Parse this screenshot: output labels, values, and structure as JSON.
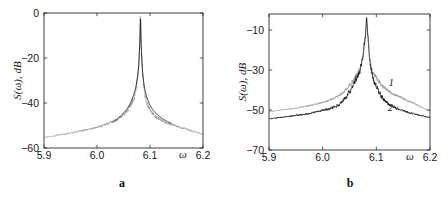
{
  "figure": {
    "background_color": "#ffffff",
    "panels": [
      {
        "caption": "a",
        "ylabel": "S(ω), dB",
        "xlabel": "ω"
      },
      {
        "caption": "b",
        "ylabel": "S(ω), dB",
        "xlabel": "ω"
      }
    ]
  },
  "chart_data": [
    {
      "type": "line",
      "panel": "a",
      "title": "",
      "xlabel": "ω",
      "ylabel": "S(ω), dB",
      "xlim": [
        5.9,
        6.2
      ],
      "ylim": [
        -60,
        0
      ],
      "xticks": [
        5.9,
        6.0,
        6.1,
        6.2
      ],
      "xticklabels": [
        "5.9",
        "6.0",
        "6.1",
        "6.2"
      ],
      "yticks": [
        -60,
        -40,
        -20,
        0
      ],
      "yticklabels": [
        "−60",
        "−40",
        "−20",
        "0"
      ],
      "grid": false,
      "legend": "none",
      "peak_omega": 6.082,
      "peak_value_db": 0,
      "series": [
        {
          "name": "experimental-noisy-spectrum",
          "color": "#9a9a9a",
          "linewidth": 0.6,
          "description": "Noisy measured spectrum, broad noise floor rising toward the resonance peak",
          "noise_amplitude_db": 2.2,
          "x": [
            5.9,
            5.91,
            5.92,
            5.93,
            5.94,
            5.95,
            5.96,
            5.97,
            5.98,
            5.99,
            6.0,
            6.01,
            6.02,
            6.03,
            6.04,
            6.05,
            6.055,
            6.06,
            6.065,
            6.07,
            6.074,
            6.078,
            6.08,
            6.082,
            6.084,
            6.086,
            6.09,
            6.094,
            6.098,
            6.102,
            6.11,
            6.12,
            6.13,
            6.14,
            6.15,
            6.16,
            6.17,
            6.18,
            6.19,
            6.2
          ],
          "y": [
            -55.5,
            -55.0,
            -54.6,
            -54.2,
            -53.8,
            -53.3,
            -52.9,
            -52.4,
            -51.9,
            -51.4,
            -50.8,
            -50.1,
            -49.3,
            -48.3,
            -47.0,
            -45.2,
            -44.0,
            -42.5,
            -40.5,
            -37.5,
            -34.0,
            -26.0,
            -16.0,
            -0.5,
            -16.5,
            -27.0,
            -36.0,
            -39.5,
            -42.0,
            -43.5,
            -46.0,
            -47.5,
            -48.5,
            -49.5,
            -50.3,
            -51.0,
            -51.8,
            -52.5,
            -53.2,
            -54.0
          ]
        },
        {
          "name": "theoretical-lorentzian",
          "color": "#1c1c1c",
          "linewidth": 0.9,
          "description": "Smooth analytical Lorentzian resonance line shape overlaying the peak",
          "x": [
            6.03,
            6.036,
            6.042,
            6.048,
            6.052,
            6.056,
            6.06,
            6.064,
            6.068,
            6.071,
            6.074,
            6.077,
            6.079,
            6.081,
            6.082,
            6.083,
            6.085,
            6.087,
            6.089,
            6.092,
            6.095,
            6.098,
            6.102,
            6.106,
            6.11,
            6.116,
            6.122,
            6.128,
            6.134,
            6.14
          ],
          "y": [
            -48.5,
            -47.5,
            -46.3,
            -45.0,
            -44.0,
            -42.8,
            -41.4,
            -39.6,
            -37.2,
            -35.0,
            -32.0,
            -27.5,
            -22.5,
            -12.0,
            -0.5,
            -12.5,
            -23.0,
            -28.5,
            -32.5,
            -35.8,
            -38.2,
            -40.0,
            -41.8,
            -43.2,
            -44.3,
            -45.6,
            -46.7,
            -47.6,
            -48.4,
            -49.0
          ]
        }
      ]
    },
    {
      "type": "line",
      "panel": "b",
      "title": "",
      "xlabel": "ω",
      "ylabel": "S(ω), dB",
      "xlim": [
        5.9,
        6.2
      ],
      "ylim": [
        -70,
        -2
      ],
      "xticks": [
        5.9,
        6.0,
        6.1,
        6.2
      ],
      "xticklabels": [
        "5.9",
        "6.0",
        "6.1",
        "6.2"
      ],
      "yticks": [
        -70,
        -50,
        -30,
        -10
      ],
      "yticklabels": [
        "−70",
        "−50",
        "−30",
        "−10"
      ],
      "grid": false,
      "legend": "inline-labels",
      "peak_omega": 6.082,
      "peak_value_db": -3,
      "annotations": [
        {
          "text": "1",
          "omega": 6.128,
          "value_db": -38.0,
          "name": "curve-label-1"
        },
        {
          "text": "2",
          "omega": 6.126,
          "value_db": -50.5,
          "name": "curve-label-2"
        }
      ],
      "series": [
        {
          "name": "spectrum-1",
          "label": "1",
          "color": "#9a9a9a",
          "linewidth": 0.7,
          "description": "Upper grey noisy spectrum, slightly higher noise floor",
          "noise_amplitude_db": 2.0,
          "x": [
            5.9,
            5.912,
            5.924,
            5.936,
            5.948,
            5.96,
            5.972,
            5.984,
            5.996,
            6.008,
            6.02,
            6.032,
            6.044,
            6.052,
            6.06,
            6.066,
            6.072,
            6.076,
            6.08,
            6.082,
            6.084,
            6.088,
            6.092,
            6.096,
            6.102,
            6.11,
            6.12,
            6.132,
            6.144,
            6.156,
            6.168,
            6.18,
            6.19,
            6.2
          ],
          "y": [
            -51.0,
            -50.4,
            -50.0,
            -49.6,
            -49.2,
            -48.6,
            -48.0,
            -47.3,
            -46.5,
            -45.6,
            -44.4,
            -42.6,
            -39.6,
            -37.0,
            -34.0,
            -31.5,
            -27.5,
            -21.0,
            -11.5,
            -3.0,
            -12.0,
            -24.0,
            -30.0,
            -32.0,
            -34.5,
            -37.5,
            -40.0,
            -42.0,
            -43.5,
            -45.0,
            -46.5,
            -48.0,
            -49.5,
            -50.5
          ]
        },
        {
          "name": "spectrum-2",
          "label": "2",
          "color": "#101010",
          "linewidth": 0.7,
          "description": "Lower black noisy spectrum, lower noise floor away from resonance",
          "noise_amplitude_db": 2.4,
          "x": [
            5.9,
            5.912,
            5.924,
            5.936,
            5.948,
            5.96,
            5.972,
            5.984,
            5.996,
            6.008,
            6.02,
            6.032,
            6.044,
            6.052,
            6.06,
            6.066,
            6.072,
            6.076,
            6.08,
            6.082,
            6.084,
            6.088,
            6.092,
            6.096,
            6.102,
            6.11,
            6.12,
            6.132,
            6.144,
            6.156,
            6.168,
            6.18,
            6.19,
            6.2
          ],
          "y": [
            -54.5,
            -54.0,
            -53.6,
            -53.2,
            -52.8,
            -52.3,
            -51.8,
            -51.2,
            -50.6,
            -49.8,
            -48.8,
            -47.0,
            -43.5,
            -40.0,
            -36.0,
            -32.5,
            -28.0,
            -21.5,
            -11.5,
            -3.0,
            -12.5,
            -25.5,
            -32.5,
            -36.0,
            -39.5,
            -43.5,
            -46.5,
            -48.5,
            -50.0,
            -51.0,
            -51.8,
            -52.6,
            -53.2,
            -53.8
          ]
        }
      ]
    }
  ]
}
